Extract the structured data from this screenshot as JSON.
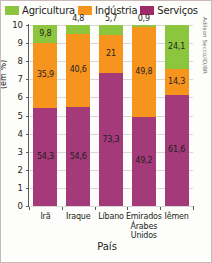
{
  "figure": {
    "credit": "Adilson Secco/ID/BR",
    "border_color": "#c9b9b9",
    "background": "#fdfdfb"
  },
  "legend": {
    "items": [
      {
        "label": "Agricultura",
        "color": "#8cc63f",
        "icon": "legend-swatch-green"
      },
      {
        "label": "Indústria",
        "color": "#f7941e",
        "icon": "legend-swatch-orange"
      },
      {
        "label": "Serviços",
        "color": "#9e2b68",
        "icon": "legend-swatch-purple"
      }
    ]
  },
  "chart_data": {
    "type": "bar",
    "stacked": true,
    "title": "",
    "xlabel": "País",
    "ylabel": "(em %)",
    "ylim": [
      0,
      10
    ],
    "ytick_labels": [
      "0",
      "1",
      "2",
      "3",
      "4",
      "5",
      "6",
      "7",
      "8",
      "9",
      "10"
    ],
    "yticks": [
      0,
      1,
      2,
      3,
      4,
      5,
      6,
      7,
      8,
      9,
      10
    ],
    "grid": true,
    "legend_position": "top",
    "note": "Os valores rótulo estão em porcentagem; cada barra soma 100%.",
    "categories": [
      "Irã",
      "Iraque",
      "Líbano",
      "Emirados Árabes Unidos",
      "Iêmen"
    ],
    "series": [
      {
        "name": "Agricultura",
        "color": "#8cc63f",
        "values": [
          9.8,
          4.8,
          5.7,
          0.9,
          24.1
        ],
        "labels": [
          "9,8",
          "4,8",
          "5,7",
          "0,9",
          "24,1"
        ]
      },
      {
        "name": "Indústria",
        "color": "#f7941e",
        "values": [
          35.9,
          40.6,
          21.0,
          49.8,
          14.3
        ],
        "labels": [
          "35,9",
          "40,6",
          "21",
          "49,8",
          "14,3"
        ]
      },
      {
        "name": "Serviços",
        "color": "#a43a7a",
        "values": [
          54.3,
          54.6,
          73.3,
          49.2,
          61.6
        ],
        "labels": [
          "54,3",
          "54,6",
          "73,3",
          "49,2",
          "61,6"
        ]
      }
    ]
  }
}
